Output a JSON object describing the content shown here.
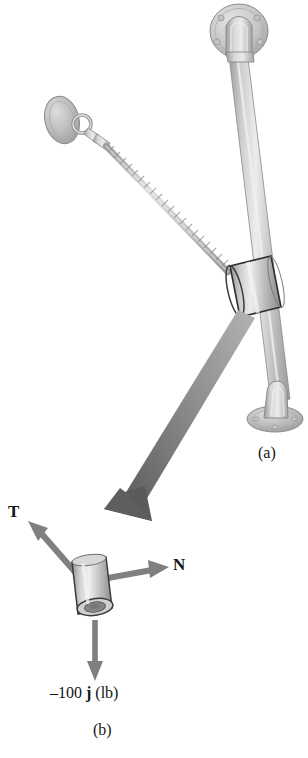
{
  "figure": {
    "kind": "engineering-statics-figure",
    "background_color": "#ffffff",
    "width": 308,
    "height": 758
  },
  "panels": [
    {
      "id": "a",
      "caption": "(a)",
      "description": "pictorial view of collar on inclined rod supported by a cable"
    },
    {
      "id": "b",
      "caption": "(b)",
      "description": "free-body diagram of the collar"
    }
  ],
  "labels": {
    "tension": "T",
    "normal": "N",
    "weight_prefix": "–100 ",
    "weight_vector": "j",
    "weight_units": " (lb)"
  },
  "colors": {
    "vector_arrow": "#808080",
    "transition_arrow_light": "#a9a9a9",
    "transition_arrow_dark": "#595959",
    "metal_light": "#e2e2e2",
    "metal_mid": "#b9b9b9",
    "metal_dark": "#8d8d8d",
    "outline": "#6e6e6e",
    "outline_dark": "#2e2e2e",
    "text": "#141414"
  },
  "vectors": [
    {
      "name": "T",
      "direction": "up-left",
      "panel": "b"
    },
    {
      "name": "N",
      "direction": "right",
      "panel": "b"
    },
    {
      "name": "-100 j (lb)",
      "direction": "down",
      "panel": "b"
    }
  ],
  "parts": [
    {
      "name": "upper-wall-flange",
      "panel": "a"
    },
    {
      "name": "inclined-rod",
      "panel": "a"
    },
    {
      "name": "lower-wall-flange",
      "panel": "a"
    },
    {
      "name": "collar",
      "panel": "a"
    },
    {
      "name": "cable",
      "panel": "a"
    },
    {
      "name": "cable-anchor-plate",
      "panel": "a"
    },
    {
      "name": "eye-bolt",
      "panel": "a"
    },
    {
      "name": "collar",
      "panel": "b"
    }
  ]
}
